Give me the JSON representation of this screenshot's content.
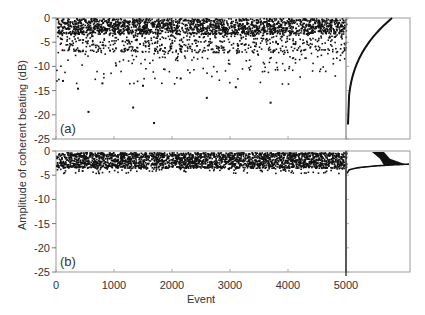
{
  "chart_data": [
    {
      "panel": "(a)",
      "type": "scatter",
      "title": "",
      "xlabel": "Event",
      "ylabel": "Amplitude of coherent beating (dB)",
      "xlim": [
        0,
        5000
      ],
      "ylim": [
        -25,
        0
      ],
      "xticks": [
        0,
        1000,
        2000,
        3000,
        4000,
        5000
      ],
      "yticks": [
        0,
        -5,
        -10,
        -15,
        -20,
        -25
      ],
      "n_points": 5000,
      "distribution": "dense band 0 to -5 dB, sparse tail to about -22 dB",
      "outliers": [
        {
          "x": 120,
          "y": -13.0
        },
        {
          "x": 380,
          "y": -14.6
        },
        {
          "x": 560,
          "y": -19.4
        },
        {
          "x": 800,
          "y": -13.5
        },
        {
          "x": 1330,
          "y": -18.5
        },
        {
          "x": 1690,
          "y": -21.7
        },
        {
          "x": 1500,
          "y": -14.0
        },
        {
          "x": 2600,
          "y": -16.5
        },
        {
          "x": 3100,
          "y": -14.3
        },
        {
          "x": 3700,
          "y": -17.5
        },
        {
          "x": 2150,
          "y": -12.5
        }
      ],
      "side_histogram": {
        "type": "cumulative",
        "shape": "rises steeply from -22 dB to 0 dB"
      },
      "grid": false,
      "legend": null
    },
    {
      "panel": "(b)",
      "type": "scatter",
      "title": "",
      "xlabel": "Event",
      "ylabel": "Amplitude of coherent beating (dB)",
      "xlim": [
        0,
        5000
      ],
      "ylim": [
        -25,
        0
      ],
      "xticks": [
        0,
        1000,
        2000,
        3000,
        4000,
        5000
      ],
      "yticks": [
        0,
        -5,
        -10,
        -15,
        -20,
        -25
      ],
      "n_points": 5000,
      "distribution": "dense band 0 to -3.5 dB, lower edge about -4.5 dB",
      "side_histogram": {
        "type": "histogram+cumulative",
        "shape": "concentrated between -0.5 and -3 dB"
      },
      "grid": false,
      "legend": null
    }
  ],
  "figure": {
    "ylabel": "Amplitude of coherent beating (dB)",
    "xlabel": "Event",
    "panel_labels": [
      "(a)",
      "(b)"
    ],
    "xtick_labels": [
      "0",
      "1000",
      "2000",
      "3000",
      "4000",
      "5000"
    ],
    "ytick_labels": [
      "0",
      "-5",
      "-10",
      "-15",
      "-20",
      "-25"
    ]
  }
}
